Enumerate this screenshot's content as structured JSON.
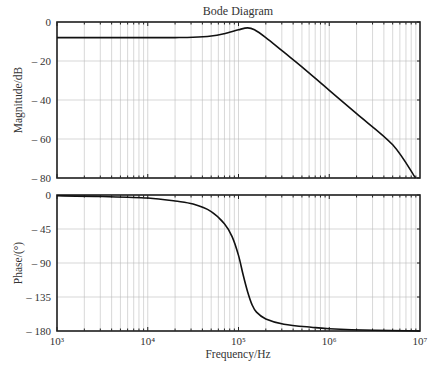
{
  "chart_data": [
    {
      "type": "line",
      "title": "Bode Diagram",
      "panel": "magnitude",
      "xlabel": "Frequency/Hz",
      "ylabel": "Magnitude/dB",
      "xscale": "log",
      "xlim": [
        1000,
        10000000
      ],
      "ylim": [
        -80,
        0
      ],
      "yticks": [
        0,
        -20,
        -40,
        -60,
        -80
      ],
      "ytick_labels": [
        "0",
        "-20",
        "-40",
        "-60",
        "-80"
      ],
      "grid": true,
      "series": [
        {
          "name": "magnitude",
          "x": [
            1000,
            3162,
            10000,
            20000,
            31623,
            50000,
            70000,
            100000,
            125893,
            150000,
            200000,
            316228,
            500000,
            1000000,
            2000000,
            5000000,
            8913000
          ],
          "values": [
            -8,
            -8,
            -8,
            -8,
            -7.8,
            -7.2,
            -6,
            -4,
            -3,
            -4,
            -8,
            -15.5,
            -23,
            -35,
            -47,
            -63,
            -80
          ]
        }
      ]
    },
    {
      "type": "line",
      "panel": "phase",
      "xlabel": "Frequency/Hz",
      "ylabel": "Phase/(°)",
      "xscale": "log",
      "xlim": [
        1000,
        10000000
      ],
      "ylim": [
        -180,
        0
      ],
      "yticks": [
        0,
        -45,
        -90,
        -135,
        -180
      ],
      "ytick_labels": [
        "0",
        "-45",
        "-90",
        "-135",
        "-180"
      ],
      "xticks": [
        1000,
        10000,
        100000,
        1000000,
        10000000
      ],
      "xtick_labels": [
        "10³",
        "10⁴",
        "10⁵",
        "10⁶",
        "10⁷"
      ],
      "grid": true,
      "series": [
        {
          "name": "phase",
          "x": [
            1000,
            3162,
            10000,
            20000,
            31623,
            50000,
            70000,
            85000,
            100000,
            112000,
            125893,
            141000,
            158000,
            200000,
            316228,
            630957,
            1000000,
            3162278,
            10000000
          ],
          "values": [
            -1,
            -2,
            -4,
            -8,
            -12,
            -22,
            -38,
            -55,
            -80,
            -105,
            -128,
            -145,
            -155,
            -164,
            -171,
            -175,
            -177,
            -179,
            -180
          ]
        }
      ]
    }
  ],
  "labels": {
    "title": "Bode Diagram",
    "mag_ylabel": "Magnitude/dB",
    "phase_ylabel": "Phase/(°)",
    "xlabel": "Frequency/Hz",
    "mag_ticks": [
      "0",
      "– 20",
      "– 40",
      "– 60",
      "– 80"
    ],
    "phase_ticks": [
      "0",
      "– 45",
      "– 90",
      "– 135",
      "– 180"
    ],
    "x_ticks": [
      "10³",
      "10⁴",
      "10⁵",
      "10⁶",
      "10⁷"
    ]
  }
}
